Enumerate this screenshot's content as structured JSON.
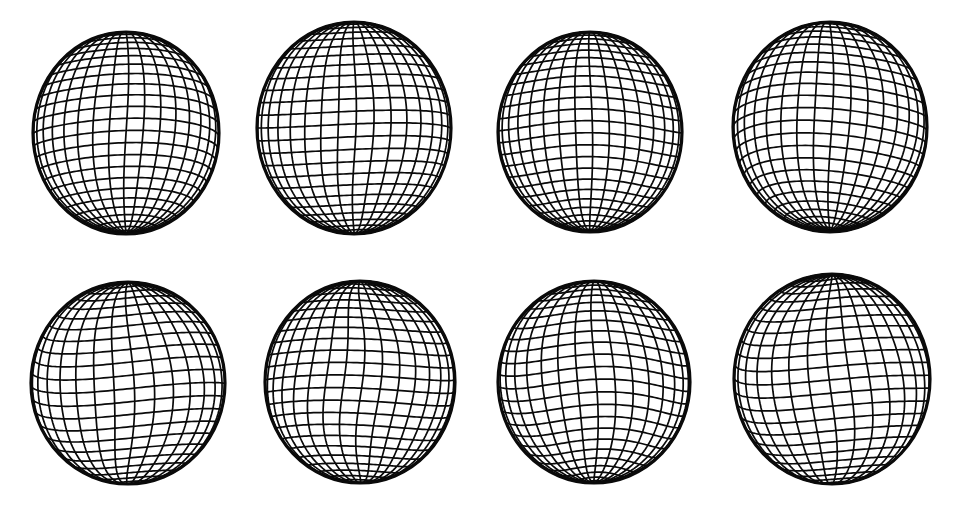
{
  "figure": {
    "type": "sphere-mesh-grid-figure",
    "background_color": "#ffffff",
    "mesh_color": "#0a0a0a",
    "fill_color": "#ffffff",
    "rows": 2,
    "columns": 4,
    "total_panels": 8,
    "width": 980,
    "height": 505
  },
  "panels": [
    {
      "id": "sphere-1",
      "row": 1,
      "column": 1,
      "cx": 126,
      "cy": 133,
      "rx": 93,
      "ry": 101,
      "meridians": 34,
      "parallels": 26,
      "tilt_deg": -7,
      "warp_amp": 0.035,
      "warp_freq": 2.0,
      "warp_phase": 0.3,
      "lat_warp_amp": 0.03,
      "lat_warp_freq": 2.0,
      "lat_phase": 0.9,
      "pole_offset": -0.1
    },
    {
      "id": "sphere-2",
      "row": 1,
      "column": 2,
      "cx": 354,
      "cy": 128,
      "rx": 97,
      "ry": 106,
      "meridians": 34,
      "parallels": 26,
      "tilt_deg": -2,
      "warp_amp": 0.025,
      "warp_freq": 3.0,
      "warp_phase": 1.1,
      "lat_warp_amp": 0.022,
      "lat_warp_freq": 2.0,
      "lat_phase": 0.2,
      "pole_offset": -0.04
    },
    {
      "id": "sphere-3",
      "row": 1,
      "column": 3,
      "cx": 590,
      "cy": 132,
      "rx": 92,
      "ry": 100,
      "meridians": 34,
      "parallels": 26,
      "tilt_deg": -5,
      "warp_amp": 0.03,
      "warp_freq": 2.0,
      "warp_phase": 2.2,
      "lat_warp_amp": 0.026,
      "lat_warp_freq": 3.0,
      "lat_phase": 1.6,
      "pole_offset": -0.08
    },
    {
      "id": "sphere-4",
      "row": 1,
      "column": 4,
      "cx": 830,
      "cy": 127,
      "rx": 97,
      "ry": 105,
      "meridians": 34,
      "parallels": 26,
      "tilt_deg": -9,
      "warp_amp": 0.04,
      "warp_freq": 2.0,
      "warp_phase": 0.8,
      "lat_warp_amp": 0.034,
      "lat_warp_freq": 2.0,
      "lat_phase": 2.6,
      "pole_offset": -0.12
    },
    {
      "id": "sphere-5",
      "row": 2,
      "column": 1,
      "cx": 128,
      "cy": 383,
      "rx": 97,
      "ry": 101,
      "meridians": 30,
      "parallels": 24,
      "tilt_deg": 4,
      "warp_amp": 0.07,
      "warp_freq": 2.0,
      "warp_phase": 1.9,
      "lat_warp_amp": 0.048,
      "lat_warp_freq": 2.0,
      "lat_phase": 0.4,
      "pole_offset": 0.06
    },
    {
      "id": "sphere-6",
      "row": 2,
      "column": 2,
      "cx": 360,
      "cy": 382,
      "rx": 95,
      "ry": 101,
      "meridians": 32,
      "parallels": 25,
      "tilt_deg": 2,
      "warp_amp": 0.055,
      "warp_freq": 3.0,
      "warp_phase": 0.5,
      "lat_warp_amp": 0.042,
      "lat_warp_freq": 2.0,
      "lat_phase": 2.1,
      "pole_offset": 0.03
    },
    {
      "id": "sphere-7",
      "row": 2,
      "column": 3,
      "cx": 594,
      "cy": 382,
      "rx": 96,
      "ry": 101,
      "meridians": 32,
      "parallels": 25,
      "tilt_deg": -3,
      "warp_amp": 0.05,
      "warp_freq": 2.0,
      "warp_phase": 2.8,
      "lat_warp_amp": 0.04,
      "lat_warp_freq": 3.0,
      "lat_phase": 1.2,
      "pole_offset": -0.05
    },
    {
      "id": "sphere-8",
      "row": 2,
      "column": 4,
      "cx": 832,
      "cy": 379,
      "rx": 98,
      "ry": 105,
      "meridians": 30,
      "parallels": 25,
      "tilt_deg": 6,
      "warp_amp": 0.075,
      "warp_freq": 2.0,
      "warp_phase": 3.4,
      "lat_warp_amp": 0.05,
      "lat_warp_freq": 2.0,
      "lat_phase": 0.7,
      "pole_offset": 0.1
    }
  ]
}
